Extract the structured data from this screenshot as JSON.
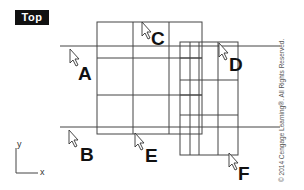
{
  "viewport": {
    "label": "Top"
  },
  "callouts": [
    {
      "id": "A",
      "label": "A"
    },
    {
      "id": "B",
      "label": "B"
    },
    {
      "id": "C",
      "label": "C"
    },
    {
      "id": "D",
      "label": "D"
    },
    {
      "id": "E",
      "label": "E"
    },
    {
      "id": "F",
      "label": "F"
    }
  ],
  "axes": {
    "y_label": "y",
    "x_label": "x"
  },
  "copyright": "© 2014 Cengage Learning®. All Rights Reserved.",
  "colors": {
    "line": "#444444",
    "label_bg": "#111111",
    "label_text": "#ffffff"
  }
}
